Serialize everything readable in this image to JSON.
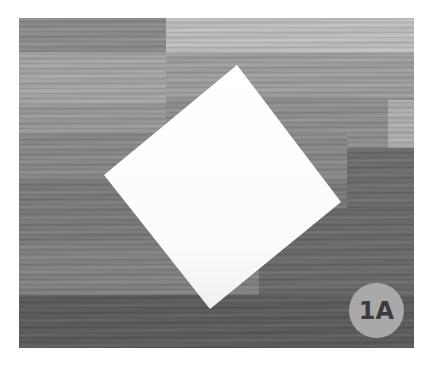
{
  "image": {
    "subject": "white square sheet of paper rotated as a diamond on a gray wood-plank surface",
    "badge": {
      "label": "1A",
      "circle_color": "#a9a9a9",
      "text_color": "#3b3b3b"
    },
    "paper": {
      "color": "#ffffff",
      "corners": {
        "top": [
          237,
          65
        ],
        "right": [
          341,
          202
        ],
        "bottom": [
          210,
          309
        ],
        "left": [
          104,
          175
        ]
      }
    },
    "colors": {
      "background": "#ffffff",
      "wood_light": "#b9b9b9",
      "wood_mid": "#8e8e8e",
      "wood_dark": "#5e5e5e"
    }
  }
}
